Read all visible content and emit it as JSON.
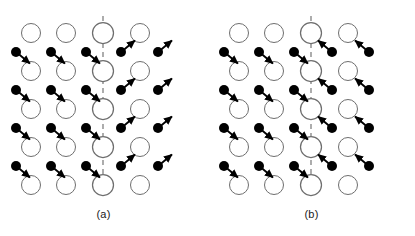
{
  "figure": {
    "type": "lattice-twin-diagram",
    "background": "#ffffff",
    "width": 415,
    "height": 236,
    "colors": {
      "open_circle_stroke": "#6e6e6e",
      "open_circle_fill": "#ffffff",
      "filled_atom": "#000000",
      "arrow": "#000000",
      "twin_plane_dashes": "#8a8a8a",
      "caption_text": "#1a1a1a"
    },
    "geometry": {
      "open_circle_radius": 9.5,
      "center_circle_radius": 10.5,
      "filled_atom_radius": 5.0,
      "arrow_length": 13,
      "twin_plane_dash_pattern": "5 4",
      "twin_plane_stroke_width": 1.4
    }
  },
  "panels": [
    {
      "id": "a",
      "caption": "(a)",
      "twin_plane": {
        "x": 103,
        "y_top": 16,
        "y_bottom": 188
      },
      "description": "Mirror-symmetric shear: atoms left of the twin plane are displaced down-right, atoms right of the plane are displaced up-right.",
      "open_rows": [
        {
          "y": 33,
          "xs": [
            31,
            66,
            103,
            140
          ]
        },
        {
          "y": 71,
          "xs": [
            31,
            66,
            103,
            140
          ]
        },
        {
          "y": 109,
          "xs": [
            31,
            66,
            103,
            140
          ]
        },
        {
          "y": 147,
          "xs": [
            31,
            66,
            103,
            140
          ]
        },
        {
          "y": 185,
          "xs": [
            31,
            66,
            103,
            140
          ]
        }
      ],
      "center_column_xs": [
        103
      ],
      "atom_rows": [
        {
          "y": 52,
          "xs": [
            16,
            51,
            86,
            121,
            158
          ]
        },
        {
          "y": 90,
          "xs": [
            16,
            51,
            86,
            121,
            158
          ]
        },
        {
          "y": 128,
          "xs": [
            16,
            51,
            86,
            121,
            158
          ]
        },
        {
          "y": 166,
          "xs": [
            16,
            51,
            86,
            121,
            158
          ]
        }
      ],
      "arrow_vectors": {
        "left_of_plane": {
          "dx": 11,
          "dy": 9,
          "label": "down-right"
        },
        "right_of_plane": {
          "dx": 11,
          "dy": -9,
          "label": "up-right"
        }
      }
    },
    {
      "id": "b",
      "caption": "(b)",
      "twin_plane": {
        "x": 103,
        "y_top": 16,
        "y_bottom": 188
      },
      "description": "Converging shear: atoms left of the twin plane are displaced down-right away from their dot, atoms right of the plane are displaced up-left toward the plane.",
      "open_rows": [
        {
          "y": 33,
          "xs": [
            31,
            66,
            103,
            140
          ]
        },
        {
          "y": 71,
          "xs": [
            31,
            66,
            103,
            140
          ]
        },
        {
          "y": 109,
          "xs": [
            31,
            66,
            103,
            140
          ]
        },
        {
          "y": 147,
          "xs": [
            31,
            66,
            103,
            140
          ]
        },
        {
          "y": 185,
          "xs": [
            31,
            66,
            103,
            140
          ]
        }
      ],
      "center_column_xs": [
        103
      ],
      "atom_rows": [
        {
          "y": 52,
          "xs": [
            16,
            51,
            86,
            124,
            161
          ]
        },
        {
          "y": 90,
          "xs": [
            16,
            51,
            86,
            124,
            161
          ]
        },
        {
          "y": 128,
          "xs": [
            16,
            51,
            86,
            124,
            161
          ]
        },
        {
          "y": 166,
          "xs": [
            16,
            51,
            86,
            124,
            161
          ]
        }
      ],
      "arrow_vectors": {
        "left_of_plane": {
          "dx": 11,
          "dy": 9,
          "label": "down-right"
        },
        "right_of_plane": {
          "dx": -11,
          "dy": -9,
          "label": "up-left"
        }
      }
    }
  ]
}
